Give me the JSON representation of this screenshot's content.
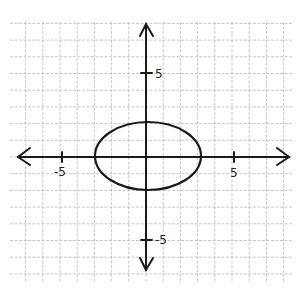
{
  "chart_data": {
    "type": "line",
    "title": "",
    "xlabel": "",
    "ylabel": "",
    "xlim": [
      -7.5,
      8.5
    ],
    "ylim": [
      -7.5,
      8
    ],
    "grid": true,
    "legend": null,
    "x_ticks": [
      {
        "value": -5,
        "label": "-5"
      },
      {
        "value": 5,
        "label": "5"
      }
    ],
    "y_ticks": [
      {
        "value": 5,
        "label": "5"
      },
      {
        "value": -5,
        "label": "-5"
      }
    ],
    "series": [
      {
        "name": "ellipse",
        "shape": "ellipse",
        "center": [
          0,
          0
        ],
        "semi_axis_x": 3.1,
        "semi_axis_y": 2,
        "equation": "x^2/9 + y^2/4 = 1",
        "points": [
          [
            -3,
            0
          ],
          [
            0,
            2
          ],
          [
            3.1,
            0
          ],
          [
            0,
            -2
          ]
        ]
      }
    ],
    "style": "hand-drawn on graph paper",
    "colors": {
      "ink": "#1a1a1a",
      "grid": "#b8b8b8"
    }
  },
  "labels": {
    "x_tick_neg5": "-5",
    "x_tick_pos5": "5",
    "y_tick_pos5": "5",
    "y_tick_neg5": "-5"
  }
}
